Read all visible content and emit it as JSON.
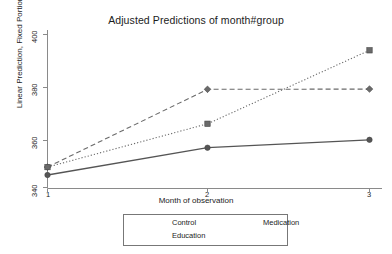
{
  "chart_data": {
    "type": "line",
    "title": "Adjusted Predictions of month#group",
    "xlabel": "Month of observation",
    "ylabel": "Linear Prediction, Fixed Portion",
    "x": [
      1,
      2,
      3
    ],
    "xticklabels": [
      "1",
      "2",
      "3"
    ],
    "yticklabels": [
      "340",
      "360",
      "380",
      "400"
    ],
    "yticks": [
      340,
      360,
      380,
      400
    ],
    "ylim": [
      335,
      402
    ],
    "xlim": [
      1,
      3
    ],
    "grid": false,
    "legend_position": "bottom-center",
    "series": [
      {
        "name": "Control",
        "values": [
          344.9,
          355.6,
          358.7
        ],
        "line_style": "solid",
        "marker": "circle",
        "color": "#555555"
      },
      {
        "name": "Medication",
        "values": [
          348.0,
          378.5,
          378.6
        ],
        "line_style": "dashed",
        "marker": "diamond",
        "color": "#6a6a6a"
      },
      {
        "name": "Education",
        "values": [
          348.0,
          365.0,
          393.8
        ],
        "line_style": "dotted",
        "marker": "square",
        "color": "#6a6a6a"
      }
    ]
  },
  "legend": {
    "items": [
      {
        "label": "Control"
      },
      {
        "label": "Medication"
      },
      {
        "label": "Education"
      }
    ]
  },
  "axes": {
    "y_tick_0": "340",
    "y_tick_1": "360",
    "y_tick_2": "380",
    "y_tick_3": "400",
    "x_tick_0": "1",
    "x_tick_1": "2",
    "x_tick_2": "3"
  }
}
